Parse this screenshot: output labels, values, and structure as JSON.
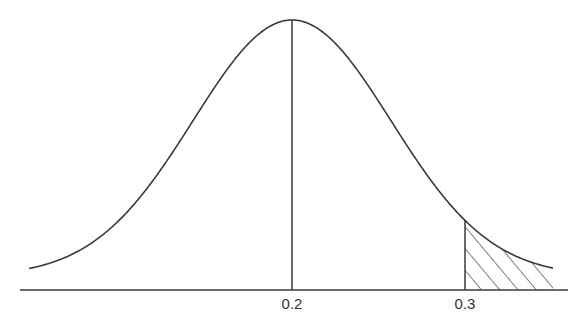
{
  "chart_data": {
    "type": "area",
    "title": "",
    "xlabel": "",
    "ylabel": "",
    "distribution": "normal",
    "mean": 0.2,
    "std_dev": 0.057,
    "x_range": [
      -0.14,
      0.41
    ],
    "tick_labels": [
      "0.2",
      "0.3"
    ],
    "tick_values": [
      0.2,
      0.3
    ],
    "vertical_lines": [
      {
        "x": 0.2,
        "label": "0.2",
        "description": "mean"
      },
      {
        "x": 0.3,
        "label": "0.3",
        "description": "critical value"
      }
    ],
    "shaded_region": {
      "from": 0.3,
      "to": 0.355,
      "pattern": "diagonal-hatch",
      "description": "right tail area"
    },
    "grid": false,
    "legend": null
  },
  "style": {
    "line_color": "#3a3a3a",
    "text_color": "#333333",
    "background": "#ffffff"
  },
  "layout": {
    "baseline_y": 290,
    "peak_y": 20,
    "tail_y": 274,
    "axis_x_start": 20,
    "axis_x_end": 568,
    "mean_px": 292,
    "sigma_px": 99,
    "curve_x_start": 29,
    "curve_x_end": 553,
    "crit_px": 465
  }
}
